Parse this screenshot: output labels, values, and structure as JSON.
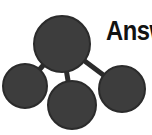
{
  "logo": {
    "background_color": "#ffffff",
    "wordmark": {
      "text": "Answ",
      "full_text_visible": "Answ",
      "color": "#121212",
      "truncated_at_right_edge": true
    },
    "graph": {
      "node_color": "#3d3d3d",
      "node_stroke_color": "#2b2b2b",
      "edge_color": "#2b2b2b",
      "nodes": [
        {
          "id": "center",
          "label": "center-node",
          "cx": 62,
          "cy": 44,
          "r": 28
        },
        {
          "id": "left",
          "label": "left-node",
          "cx": 25,
          "cy": 86,
          "r": 22
        },
        {
          "id": "bottom",
          "label": "bottom-node",
          "cx": 72,
          "cy": 105,
          "r": 24
        },
        {
          "id": "right",
          "label": "right-node",
          "cx": 122,
          "cy": 89,
          "r": 23
        }
      ],
      "edges": [
        {
          "from": "center",
          "to": "left"
        },
        {
          "from": "center",
          "to": "bottom"
        },
        {
          "from": "center",
          "to": "right"
        }
      ]
    }
  }
}
